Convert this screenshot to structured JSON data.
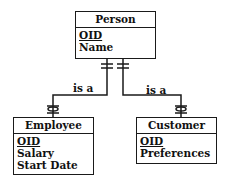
{
  "diagram": {
    "type": "ER supertype/subtype diagram",
    "entities": {
      "person": {
        "name": "Person",
        "attributes": [
          {
            "name": "OID",
            "primary_key": true
          },
          {
            "name": "Name",
            "primary_key": false
          }
        ]
      },
      "employee": {
        "name": "Employee",
        "attributes": [
          {
            "name": "OID",
            "primary_key": true
          },
          {
            "name": "Salary",
            "primary_key": false
          },
          {
            "name": "Start Date",
            "primary_key": false
          }
        ]
      },
      "customer": {
        "name": "Customer",
        "attributes": [
          {
            "name": "OID",
            "primary_key": true
          },
          {
            "name": "Preferences",
            "primary_key": false
          }
        ]
      }
    },
    "relationships": [
      {
        "label": "is a",
        "from": "Person",
        "to": "Employee"
      },
      {
        "label": "is a",
        "from": "Person",
        "to": "Customer"
      }
    ]
  }
}
